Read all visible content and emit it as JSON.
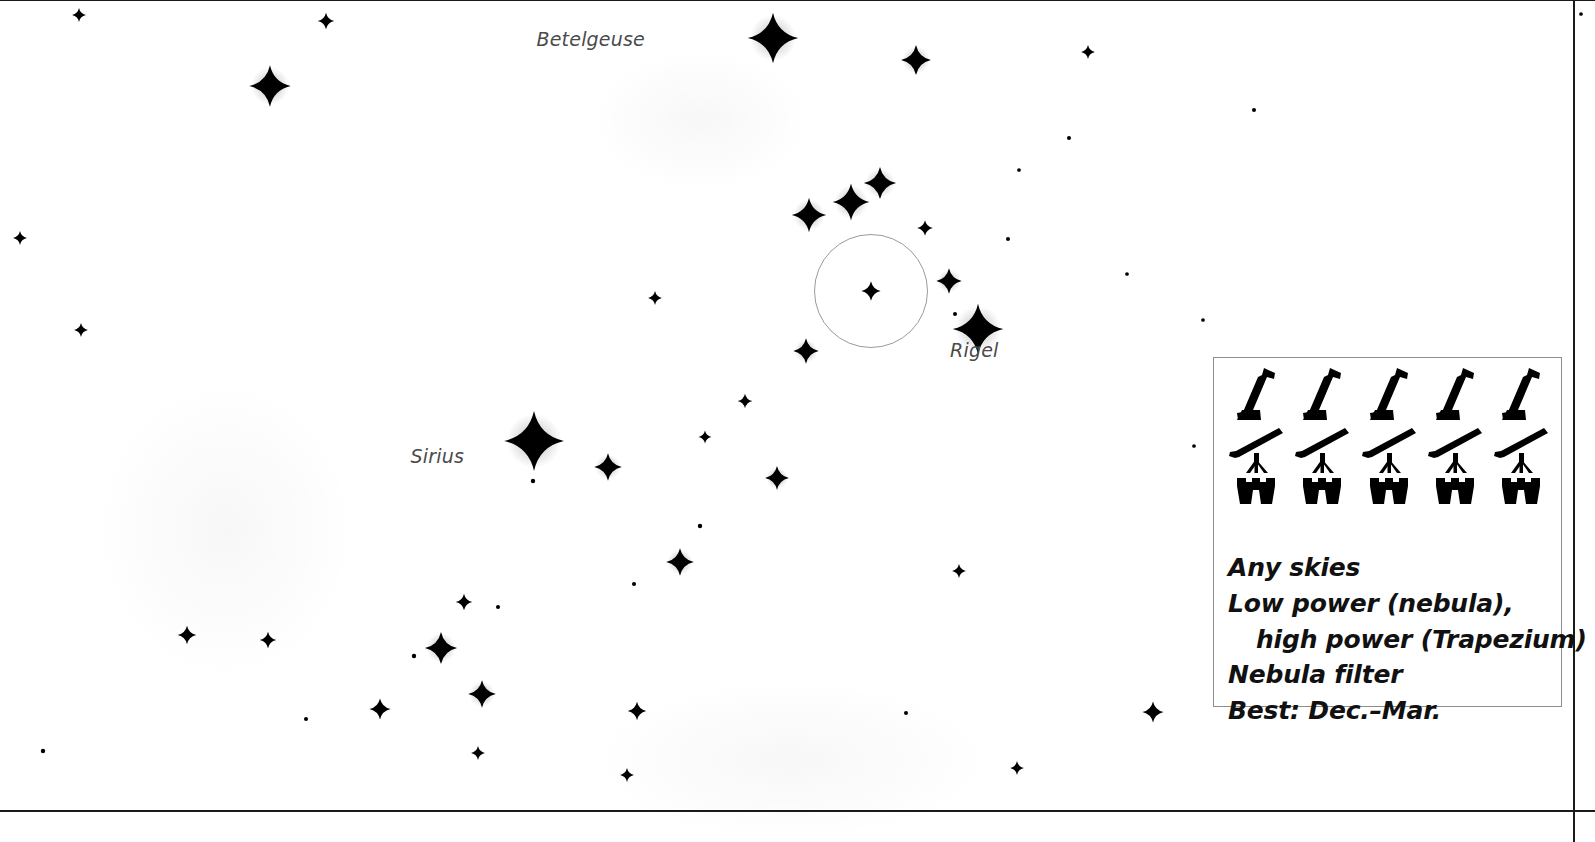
{
  "page": {
    "width": 1595,
    "height": 842,
    "background": "#ffffff",
    "ink": "#111111",
    "label_color": "#4a4a4a",
    "rule_color": "#1a1a1a",
    "box_border_color": "#8d8d8d"
  },
  "credit": {
    "text": "Star maps courtesy Starry Night Education / Simulation Curriculum"
  },
  "rules": [
    {
      "name": "top-rule",
      "y": 0,
      "thickness": 1
    },
    {
      "name": "bottom-rule",
      "y": 810,
      "thickness": 2
    }
  ],
  "chart_data": {
    "type": "scatter",
    "title": "",
    "xlabel": "",
    "ylabel": "",
    "xlim": [
      0,
      1595
    ],
    "ylim": [
      0,
      842
    ],
    "grid": false,
    "legend": "none",
    "note": "Star chart of the Orion / Canis Major region. x,y are pixel positions on the plate; r is plotted star radius in px (brighter = larger).",
    "named_stars": [
      {
        "name": "Betelgeuse",
        "x": 773,
        "y": 38,
        "r": 11,
        "label_dx": -128,
        "label_dy": -10,
        "label_align": "right"
      },
      {
        "name": "Rigel",
        "x": 978,
        "y": 329,
        "r": 11,
        "label_dx": -28,
        "label_dy": 10,
        "label_align": "left"
      },
      {
        "name": "Sirius",
        "x": 534,
        "y": 441,
        "r": 13,
        "label_dx": -70,
        "label_dy": 4,
        "label_align": "right"
      }
    ],
    "deep_sky_objects": [
      {
        "name": "M42 Orion Nebula",
        "cx": 871,
        "cy": 291,
        "radius": 57
      }
    ],
    "stars": [
      {
        "x": 79,
        "y": 15,
        "r": 3.0
      },
      {
        "x": 326,
        "y": 21,
        "r": 3.6
      },
      {
        "x": 270,
        "y": 86,
        "r": 9.0
      },
      {
        "x": 916,
        "y": 60,
        "r": 6.5
      },
      {
        "x": 1088,
        "y": 52,
        "r": 3.0
      },
      {
        "x": 1069,
        "y": 138,
        "r": 2.4
      },
      {
        "x": 1254,
        "y": 110,
        "r": 2.4
      },
      {
        "x": 1581,
        "y": 14,
        "r": 2.2
      },
      {
        "x": 880,
        "y": 183,
        "r": 7.0
      },
      {
        "x": 851,
        "y": 202,
        "r": 8.0
      },
      {
        "x": 809,
        "y": 215,
        "r": 7.5
      },
      {
        "x": 925,
        "y": 228,
        "r": 3.4
      },
      {
        "x": 1008,
        "y": 239,
        "r": 2.4
      },
      {
        "x": 20,
        "y": 238,
        "r": 3.0
      },
      {
        "x": 1019,
        "y": 170,
        "r": 2.2
      },
      {
        "x": 949,
        "y": 281,
        "r": 5.5
      },
      {
        "x": 871,
        "y": 291,
        "r": 4.2
      },
      {
        "x": 955,
        "y": 314,
        "r": 2.4
      },
      {
        "x": 806,
        "y": 351,
        "r": 5.5
      },
      {
        "x": 81,
        "y": 330,
        "r": 3.0
      },
      {
        "x": 1127,
        "y": 274,
        "r": 2.2
      },
      {
        "x": 655,
        "y": 298,
        "r": 3.0
      },
      {
        "x": 745,
        "y": 401,
        "r": 3.2
      },
      {
        "x": 705,
        "y": 437,
        "r": 2.8
      },
      {
        "x": 608,
        "y": 467,
        "r": 6.0
      },
      {
        "x": 777,
        "y": 478,
        "r": 5.2
      },
      {
        "x": 533,
        "y": 481,
        "r": 2.6
      },
      {
        "x": 700,
        "y": 526,
        "r": 2.6
      },
      {
        "x": 680,
        "y": 562,
        "r": 6.0
      },
      {
        "x": 634,
        "y": 584,
        "r": 2.4
      },
      {
        "x": 959,
        "y": 571,
        "r": 3.0
      },
      {
        "x": 464,
        "y": 602,
        "r": 3.6
      },
      {
        "x": 498,
        "y": 607,
        "r": 2.4
      },
      {
        "x": 187,
        "y": 635,
        "r": 4.0
      },
      {
        "x": 268,
        "y": 640,
        "r": 3.6
      },
      {
        "x": 414,
        "y": 656,
        "r": 2.6
      },
      {
        "x": 441,
        "y": 648,
        "r": 7.0
      },
      {
        "x": 482,
        "y": 694,
        "r": 6.0
      },
      {
        "x": 380,
        "y": 709,
        "r": 4.6
      },
      {
        "x": 306,
        "y": 719,
        "r": 2.4
      },
      {
        "x": 637,
        "y": 711,
        "r": 4.0
      },
      {
        "x": 478,
        "y": 753,
        "r": 3.0
      },
      {
        "x": 627,
        "y": 775,
        "r": 3.0
      },
      {
        "x": 1017,
        "y": 768,
        "r": 3.0
      },
      {
        "x": 43,
        "y": 751,
        "r": 2.6
      },
      {
        "x": 1153,
        "y": 712,
        "r": 4.6
      },
      {
        "x": 906,
        "y": 713,
        "r": 2.4
      },
      {
        "x": 1203,
        "y": 320,
        "r": 2.2
      },
      {
        "x": 1194,
        "y": 446,
        "r": 2.2
      }
    ],
    "nebulosity": [
      {
        "cx": 225,
        "cy": 530,
        "rx": 130,
        "ry": 150
      },
      {
        "cx": 790,
        "cy": 760,
        "rx": 200,
        "ry": 80
      },
      {
        "cx": 700,
        "cy": 120,
        "rx": 110,
        "ry": 70
      }
    ]
  },
  "info_box": {
    "name": "observing-info-box",
    "rating": {
      "max": 5,
      "rows": [
        {
          "instrument": "reflector-telescope",
          "filled": 5
        },
        {
          "instrument": "refractor-telescope",
          "filled": 5
        },
        {
          "instrument": "binoculars",
          "filled": 5
        }
      ]
    },
    "lines": [
      {
        "text": "Any skies",
        "indent": false
      },
      {
        "text": "Low power (nebula),",
        "indent": false
      },
      {
        "text": "high power (Trapezium)",
        "indent": true
      },
      {
        "text": "Nebula filter",
        "indent": false
      },
      {
        "text": "Best: Dec.–Mar.",
        "indent": false
      }
    ]
  }
}
